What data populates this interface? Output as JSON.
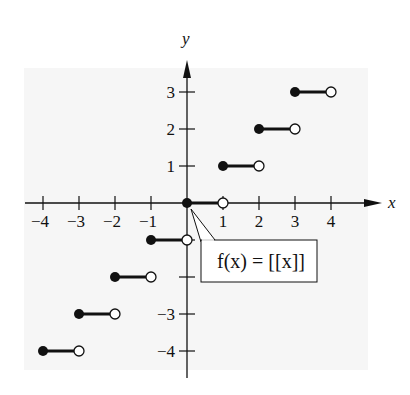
{
  "chart_data": {
    "type": "line",
    "subtype": "step-function",
    "title": "",
    "xlabel": "x",
    "ylabel": "y",
    "xlim": [
      -4.5,
      5.2
    ],
    "ylim": [
      -4.5,
      4.2
    ],
    "x_ticks": [
      -4,
      -3,
      -2,
      -1,
      1,
      2,
      3,
      4
    ],
    "x_tick_labels": [
      "−4",
      "−3",
      "−2",
      "−1",
      "1",
      "2",
      "3",
      "4"
    ],
    "y_ticks": [
      -4,
      -3,
      -2,
      -1,
      1,
      2,
      3
    ],
    "y_tick_labels": [
      {
        "value": -4,
        "label": "−4"
      },
      {
        "value": -3,
        "label": "−3"
      },
      {
        "value": 1,
        "label": "1"
      },
      {
        "value": 2,
        "label": "2"
      },
      {
        "value": 3,
        "label": "3"
      }
    ],
    "grid": false,
    "series": [
      {
        "name": "f(x) = [[x]]",
        "segments": [
          {
            "x_start": -4,
            "x_end": -3,
            "y": -4,
            "start": "closed",
            "end": "open"
          },
          {
            "x_start": -3,
            "x_end": -2,
            "y": -3,
            "start": "closed",
            "end": "open"
          },
          {
            "x_start": -2,
            "x_end": -1,
            "y": -2,
            "start": "closed",
            "end": "open"
          },
          {
            "x_start": -1,
            "x_end": 0,
            "y": -1,
            "start": "closed",
            "end": "open"
          },
          {
            "x_start": 0,
            "x_end": 1,
            "y": 0,
            "start": "closed",
            "end": "open"
          },
          {
            "x_start": 1,
            "x_end": 2,
            "y": 1,
            "start": "closed",
            "end": "open"
          },
          {
            "x_start": 2,
            "x_end": 3,
            "y": 2,
            "start": "closed",
            "end": "open"
          },
          {
            "x_start": 3,
            "x_end": 4,
            "y": 3,
            "start": "closed",
            "end": "open"
          }
        ]
      }
    ],
    "annotations": [
      {
        "text": "f(x) = [[x]]",
        "points_to": [
          0,
          0
        ],
        "style": "boxed callout"
      }
    ]
  },
  "colors": {
    "background": "#ffffff",
    "panel": "#f6f6f6",
    "ink": "#111111"
  }
}
